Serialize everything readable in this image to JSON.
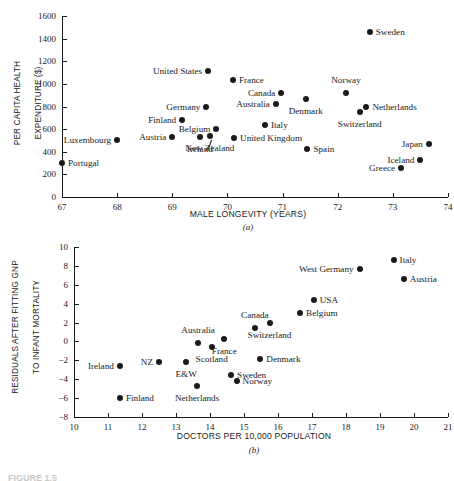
{
  "figure": {
    "caption": "FIGURE 1.5"
  },
  "panel_a": {
    "letter": "(a)",
    "xlabel": "MALE LONGEVITY (YEARS)",
    "ylabel_line1": "PER CAPITA HEALTH",
    "ylabel_line2": "EXPENDITURE ($)"
  },
  "panel_b": {
    "letter": "(b)",
    "xlabel": "DOCTORS PER 10,000 POPULATION",
    "ylabel_line1": "RESIDUALS AFTER FITTING GNP",
    "ylabel_line2": "TO INFANT MORTALITY"
  },
  "chart_data": [
    {
      "type": "scatter",
      "id": "a",
      "title": "",
      "xlabel": "MALE LONGEVITY (YEARS)",
      "ylabel": "PER CAPITA HEALTH EXPENDITURE ($)",
      "xlim": [
        67,
        74
      ],
      "ylim": [
        0,
        1600
      ],
      "xticks": [
        67,
        68,
        69,
        70,
        71,
        72,
        73,
        74
      ],
      "yticks": [
        0,
        200,
        400,
        600,
        800,
        1000,
        1200,
        1400,
        1600
      ],
      "grid": false,
      "legend": "none",
      "points": [
        {
          "label": "Portugal",
          "x": 67.0,
          "y": 300,
          "side": "right"
        },
        {
          "label": "Luxembourg",
          "x": 68.0,
          "y": 500,
          "side": "left"
        },
        {
          "label": "Austria",
          "x": 69.0,
          "y": 530,
          "side": "left"
        },
        {
          "label": "Finland",
          "x": 69.18,
          "y": 680,
          "side": "left"
        },
        {
          "label": "Germany",
          "x": 69.62,
          "y": 800,
          "side": "left"
        },
        {
          "label": "United States",
          "x": 69.65,
          "y": 1110,
          "side": "left"
        },
        {
          "label": "Ireland",
          "x": 69.5,
          "y": 530,
          "side": "below"
        },
        {
          "label": "New Zealand",
          "x": 69.68,
          "y": 540,
          "side": "below"
        },
        {
          "label": "Belgium",
          "x": 69.8,
          "y": 598,
          "side": "left"
        },
        {
          "label": "France",
          "x": 70.1,
          "y": 1030,
          "side": "right"
        },
        {
          "label": "United Kingdom",
          "x": 70.12,
          "y": 518,
          "side": "right"
        },
        {
          "label": "Australia",
          "x": 70.88,
          "y": 820,
          "side": "left"
        },
        {
          "label": "Canada",
          "x": 70.98,
          "y": 915,
          "side": "left"
        },
        {
          "label": "Italy",
          "x": 70.68,
          "y": 640,
          "side": "right"
        },
        {
          "label": "Spain",
          "x": 71.45,
          "y": 425,
          "side": "right"
        },
        {
          "label": "Denmark",
          "x": 71.42,
          "y": 865,
          "side": "below"
        },
        {
          "label": "Norway",
          "x": 72.15,
          "y": 920,
          "side": "above"
        },
        {
          "label": "Switzerland",
          "x": 72.4,
          "y": 750,
          "side": "below"
        },
        {
          "label": "Netherlands",
          "x": 72.52,
          "y": 795,
          "side": "right"
        },
        {
          "label": "Sweden",
          "x": 72.58,
          "y": 1455,
          "side": "right"
        },
        {
          "label": "Greece",
          "x": 73.15,
          "y": 255,
          "side": "left"
        },
        {
          "label": "Iceland",
          "x": 73.5,
          "y": 330,
          "side": "left"
        },
        {
          "label": "Japan",
          "x": 73.65,
          "y": 465,
          "side": "left"
        }
      ]
    },
    {
      "type": "scatter",
      "id": "b",
      "title": "",
      "xlabel": "DOCTORS PER 10,000 POPULATION",
      "ylabel": "RESIDUALS AFTER FITTING GNP TO INFANT MORTALITY",
      "xlim": [
        10,
        21
      ],
      "ylim": [
        -8,
        10
      ],
      "xticks": [
        10,
        11,
        12,
        13,
        14,
        15,
        16,
        17,
        18,
        19,
        20,
        21
      ],
      "yticks": [
        -8,
        -6,
        -4,
        -2,
        0,
        2,
        4,
        6,
        8,
        10
      ],
      "grid": false,
      "legend": "none",
      "points": [
        {
          "label": "Ireland",
          "x": 11.35,
          "y": -2.6,
          "side": "left"
        },
        {
          "label": "Finland",
          "x": 11.35,
          "y": -6.0,
          "side": "right"
        },
        {
          "label": "NZ",
          "x": 12.5,
          "y": -2.2,
          "side": "left"
        },
        {
          "label": "E&W",
          "x": 13.3,
          "y": -2.15,
          "side": "below"
        },
        {
          "label": "Netherlands",
          "x": 13.62,
          "y": -4.7,
          "side": "below"
        },
        {
          "label": "Australia",
          "x": 13.65,
          "y": -0.2,
          "side": "above"
        },
        {
          "label": "Scotland",
          "x": 14.05,
          "y": -0.55,
          "side": "below"
        },
        {
          "label": "France",
          "x": 14.42,
          "y": 0.3,
          "side": "below"
        },
        {
          "label": "Sweden",
          "x": 14.62,
          "y": -3.6,
          "side": "right"
        },
        {
          "label": "Norway",
          "x": 14.78,
          "y": -4.2,
          "side": "right"
        },
        {
          "label": "Canada",
          "x": 15.32,
          "y": 1.45,
          "side": "above"
        },
        {
          "label": "Denmark",
          "x": 15.48,
          "y": -1.9,
          "side": "right"
        },
        {
          "label": "Switzerland",
          "x": 15.75,
          "y": 2.0,
          "side": "below"
        },
        {
          "label": "Belgium",
          "x": 16.65,
          "y": 3.0,
          "side": "right"
        },
        {
          "label": "USA",
          "x": 17.05,
          "y": 4.4,
          "side": "right"
        },
        {
          "label": "West Germany",
          "x": 18.4,
          "y": 7.7,
          "side": "left"
        },
        {
          "label": "Italy",
          "x": 19.4,
          "y": 8.6,
          "side": "right"
        },
        {
          "label": "Austria",
          "x": 19.7,
          "y": 6.65,
          "side": "right"
        }
      ]
    }
  ]
}
